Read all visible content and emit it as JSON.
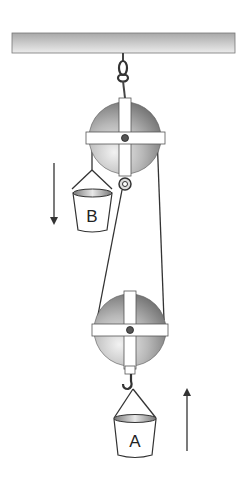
{
  "diagram": {
    "labels": {
      "bucket_b": "B",
      "bucket_a": "A"
    },
    "arrows": {
      "left": "down",
      "right": "up"
    },
    "colors": {
      "ceiling_top": "#9a9a9a",
      "ceiling_bottom": "#e6e6e6",
      "pulley_dark": "#6a6a6a",
      "pulley_light": "#e0e0e0",
      "rope": "#333333",
      "spokes": "#ffffff"
    }
  }
}
